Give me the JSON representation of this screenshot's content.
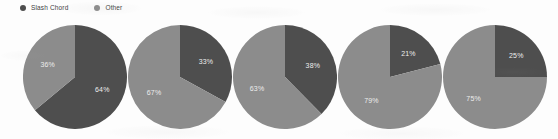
{
  "legend": {
    "position": "top-left",
    "items": [
      {
        "label": "Slash Chord",
        "color": "#4e4e4e",
        "icon": "circle-swatch-icon"
      },
      {
        "label": "Other",
        "color": "#8c8c8c",
        "icon": "circle-swatch-icon"
      }
    ]
  },
  "colors": {
    "slash_chord": "#4e4e4e",
    "other": "#8c8c8c",
    "background": "#fdfdfd",
    "label_text": "#ededed",
    "legend_text": "#3f3f3f"
  },
  "chart_data": {
    "type": "pie",
    "title": "",
    "subtitle": "",
    "xlabel": "",
    "ylabel": "",
    "grid": false,
    "legend_position": "top-left",
    "legend_entries": [
      "Slash Chord",
      "Other"
    ],
    "small_multiples": true,
    "start_angle_deg": 0,
    "direction": "clockwise",
    "charts": [
      {
        "index": 1,
        "slices": [
          {
            "name": "Slash Chord",
            "value": 64,
            "label": "64%",
            "color": "#4e4e4e"
          },
          {
            "name": "Other",
            "value": 36,
            "label": "36%",
            "color": "#8c8c8c"
          }
        ]
      },
      {
        "index": 2,
        "slices": [
          {
            "name": "Slash Chord",
            "value": 33,
            "label": "33%",
            "color": "#4e4e4e"
          },
          {
            "name": "Other",
            "value": 67,
            "label": "67%",
            "color": "#8c8c8c"
          }
        ]
      },
      {
        "index": 3,
        "slices": [
          {
            "name": "Slash Chord",
            "value": 38,
            "label": "38%",
            "color": "#4e4e4e"
          },
          {
            "name": "Other",
            "value": 63,
            "label": "63%",
            "color": "#8c8c8c"
          }
        ]
      },
      {
        "index": 4,
        "slices": [
          {
            "name": "Slash Chord",
            "value": 21,
            "label": "21%",
            "color": "#4e4e4e"
          },
          {
            "name": "Other",
            "value": 79,
            "label": "79%",
            "color": "#8c8c8c"
          }
        ]
      },
      {
        "index": 5,
        "slices": [
          {
            "name": "Slash Chord",
            "value": 25,
            "label": "25%",
            "color": "#4e4e4e"
          },
          {
            "name": "Other",
            "value": 75,
            "label": "75%",
            "color": "#8c8c8c"
          }
        ]
      }
    ]
  },
  "layout": {
    "pie_lefts": [
      23,
      128,
      233,
      338,
      443
    ],
    "pie_diameter": 104,
    "label_radius_factor": 0.58
  }
}
